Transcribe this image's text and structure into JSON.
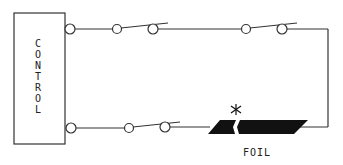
{
  "diagram": {
    "type": "circuit-schematic",
    "control_box": {
      "label": "C\nO\nN\nT\nR\nO\nL"
    },
    "foil": {
      "label": "FOIL",
      "break_marker": "*"
    },
    "top_wire": {
      "switches": 2,
      "state": "open"
    },
    "bottom_wire": {
      "switches": 1,
      "state": "open"
    }
  }
}
